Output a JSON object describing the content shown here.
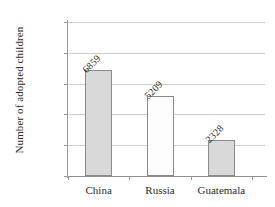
{
  "chart_data": {
    "type": "bar",
    "title": "",
    "xlabel": "",
    "ylabel": "Number of adopted children",
    "categories": [
      "China",
      "Russia",
      "Guatemala"
    ],
    "values": [
      6859,
      5209,
      2328
    ],
    "value_labels": [
      "6859",
      "5209",
      "2328"
    ],
    "bar_styles": [
      "filled",
      "hollow",
      "filled"
    ],
    "bar_fill_colors": [
      "#d9d9d9",
      "#fdfdfd",
      "#d9d9d9"
    ],
    "bar_border_color": "#8a8a8a",
    "ylim": [
      0,
      10000
    ],
    "ytick_values": [
      0,
      2000,
      4000,
      6000,
      8000,
      10000
    ],
    "ytick_labels": [
      "0",
      "2,000",
      "4,000",
      "6,000",
      "8,000",
      "10,000"
    ],
    "grid": "horizontal",
    "gridline_color": "#cfcfcf",
    "legend": "none",
    "axis_color": "#9a9a9a",
    "background_color": "#ffffff",
    "value_label_rotation_deg": -45
  },
  "axes": {
    "y_title": "Number of adopted children"
  }
}
